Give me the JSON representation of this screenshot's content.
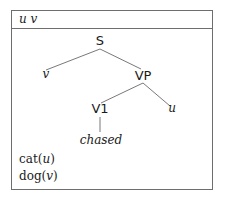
{
  "drs": {
    "universe": "u v",
    "tree": {
      "nodes": {
        "S": "S",
        "v": "v",
        "VP": "VP",
        "V1": "V1",
        "u": "u",
        "chased": "chased"
      },
      "edges": [
        [
          "S",
          "v"
        ],
        [
          "S",
          "VP"
        ],
        [
          "VP",
          "V1"
        ],
        [
          "VP",
          "u"
        ],
        [
          "V1",
          "chased"
        ]
      ]
    },
    "conditions": [
      {
        "pred": "cat",
        "arg": "u"
      },
      {
        "pred": "dog",
        "arg": "v"
      }
    ]
  }
}
